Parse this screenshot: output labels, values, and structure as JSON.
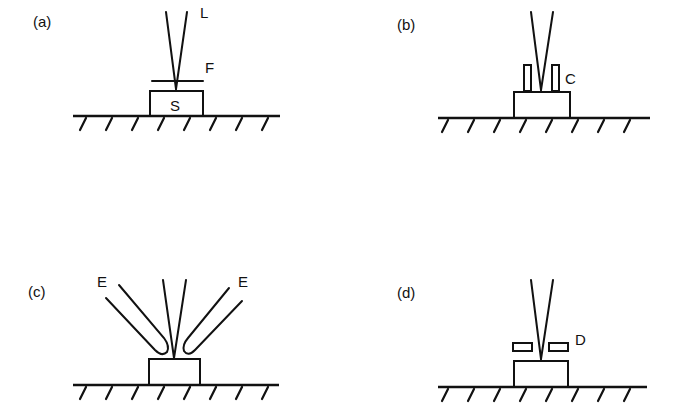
{
  "figure": {
    "panels": [
      {
        "id": "a",
        "label": "(a)",
        "annotations": {
          "laser": "L",
          "filter": "F",
          "sample": "S"
        }
      },
      {
        "id": "b",
        "label": "(b)",
        "annotations": {
          "collector": "C"
        }
      },
      {
        "id": "c",
        "label": "(c)",
        "annotations": {
          "electrode_left": "E",
          "electrode_right": "E"
        }
      },
      {
        "id": "d",
        "label": "(d)",
        "annotations": {
          "deflector": "D"
        }
      }
    ]
  }
}
